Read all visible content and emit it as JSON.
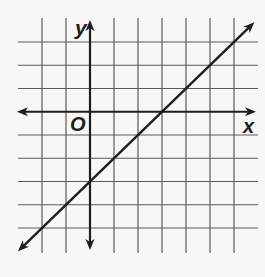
{
  "chart_data": {
    "type": "line",
    "title": "",
    "xlabel": "x",
    "ylabel": "y",
    "origin_label": "O",
    "grid": true,
    "xlim": [
      -2,
      6
    ],
    "ylim": [
      -5,
      3
    ],
    "x_tick_step": 1,
    "y_tick_step": 1,
    "series": [
      {
        "name": "line",
        "equation": "y = x - 3",
        "slope": 1,
        "y_intercept": -3,
        "x_intercept": 3,
        "x": [
          -3,
          0,
          3,
          7
        ],
        "y": [
          -6,
          -3,
          0,
          4
        ],
        "arrows_both_ends": true
      }
    ]
  },
  "labels": {
    "x_axis": "x",
    "y_axis": "y",
    "origin": "O"
  },
  "colors": {
    "background": "#f7f7f5",
    "grid": "#5a5a5a",
    "axis": "#1e1e1e",
    "line": "#1e1e1e"
  }
}
